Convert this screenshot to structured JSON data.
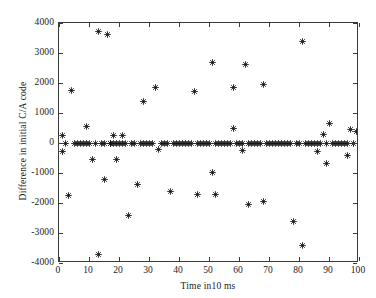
{
  "chart_data": {
    "type": "scatter",
    "title": "",
    "xlabel": "Time  in10 ms",
    "ylabel": "Difference in initial C/A code",
    "xlim": [
      0,
      100
    ],
    "ylim": [
      -4000,
      4000
    ],
    "xticks": [
      0,
      10,
      20,
      30,
      40,
      50,
      60,
      70,
      80,
      90,
      100
    ],
    "yticks": [
      -4000,
      -3000,
      -2000,
      -1000,
      0,
      1000,
      2000,
      3000,
      4000
    ],
    "xtick_labels": [
      "0",
      "10",
      "20",
      "30",
      "40",
      "50",
      "60",
      "70",
      "80",
      "90",
      "100"
    ],
    "ytick_labels": [
      "-4000",
      "-3000",
      "-2000",
      "-1000",
      "0",
      "1000",
      "2000",
      "3000",
      "4000"
    ],
    "grid": false,
    "legend": null,
    "marker": "plus-star",
    "marker_color": "#111111",
    "series": [
      {
        "name": "Difference in initial C/A code",
        "x": [
          1,
          1,
          2,
          3,
          4,
          5,
          6,
          7,
          8,
          9,
          9,
          10,
          11,
          12,
          13,
          13,
          14,
          15,
          15,
          16,
          17,
          17,
          18,
          18,
          19,
          19,
          20,
          21,
          21,
          22,
          23,
          24,
          25,
          26,
          27,
          28,
          28,
          29,
          30,
          31,
          32,
          33,
          34,
          35,
          36,
          37,
          38,
          39,
          40,
          41,
          42,
          43,
          44,
          45,
          46,
          46,
          47,
          48,
          49,
          50,
          51,
          51,
          52,
          52,
          53,
          54,
          55,
          56,
          57,
          58,
          58,
          59,
          60,
          61,
          61,
          62,
          63,
          63,
          64,
          65,
          66,
          67,
          68,
          68,
          69,
          70,
          71,
          72,
          73,
          74,
          75,
          76,
          77,
          78,
          79,
          80,
          81,
          81,
          82,
          83,
          84,
          85,
          86,
          86,
          87,
          88,
          89,
          89,
          90,
          91,
          92,
          93,
          94,
          95,
          96,
          96,
          97,
          98,
          99
        ],
        "y": [
          250,
          -280,
          0,
          -1750,
          1740,
          0,
          0,
          0,
          0,
          550,
          0,
          0,
          -560,
          0,
          3720,
          -3730,
          0,
          -1210,
          0,
          3620,
          0,
          0,
          250,
          0,
          -550,
          0,
          0,
          250,
          0,
          0,
          -2420,
          0,
          0,
          -1390,
          0,
          1400,
          0,
          0,
          0,
          0,
          1840,
          -220,
          0,
          0,
          0,
          -1630,
          0,
          0,
          0,
          0,
          0,
          0,
          0,
          1720,
          0,
          -1710,
          0,
          0,
          0,
          0,
          2680,
          -970,
          0,
          -1710,
          0,
          0,
          0,
          0,
          0,
          470,
          1840,
          0,
          0,
          -250,
          0,
          2620,
          -2060,
          0,
          0,
          0,
          0,
          0,
          1940,
          -1940,
          0,
          0,
          0,
          0,
          0,
          0,
          0,
          0,
          0,
          -2600,
          0,
          0,
          3370,
          -3400,
          0,
          0,
          0,
          0,
          0,
          -290,
          0,
          280,
          0,
          -680,
          660,
          0,
          0,
          0,
          0,
          0,
          0,
          -430,
          450,
          0,
          400
        ]
      }
    ]
  },
  "figure": {
    "background_color": "#ffffff",
    "axis_color": "#3a3a3a"
  }
}
